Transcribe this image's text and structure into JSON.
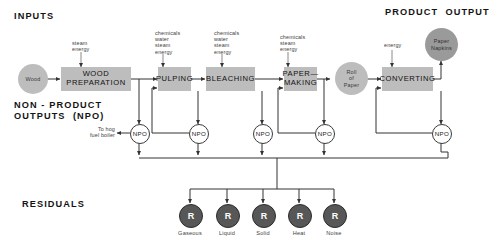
{
  "diagram": {
    "headings": {
      "inputs": "INPUTS",
      "product_output": "PRODUCT  OUTPUT",
      "non_product_outputs": "NON - PRODUCT\nOUTPUTS  (NPO)",
      "residuals": "RESIDUALS"
    },
    "colors": {
      "process_fill": "#bdbdbd",
      "material_fill": "#bdbdbd",
      "product_fill": "#9a9a9a",
      "npo_fill": "#ffffff",
      "residual_fill": "#575757",
      "line": "#333333",
      "text": "#1a1a1a"
    },
    "processes": [
      {
        "id": "wood-preparation",
        "label": "WOOD\nPREPARATION"
      },
      {
        "id": "pulping",
        "label": "PULPING"
      },
      {
        "id": "bleaching",
        "label": "BLEACHING"
      },
      {
        "id": "paper-making",
        "label": "PAPER—\nMAKING"
      },
      {
        "id": "converting",
        "label": "CONVERTING"
      }
    ],
    "materials": [
      {
        "id": "wood",
        "label": "Wood"
      },
      {
        "id": "roll-of-paper",
        "label": "Roll\nof\nPaper"
      }
    ],
    "product": {
      "id": "paper-napkins",
      "label": "Paper\nNapkins"
    },
    "input_labels": [
      {
        "id": "input-wood-preparation",
        "label": "steam\nenergy"
      },
      {
        "id": "input-pulping",
        "label": "chemicals\nwater\nsteam\nenergy"
      },
      {
        "id": "input-bleaching",
        "label": "chemicals\nwater\nsteam\nenergy"
      },
      {
        "id": "input-paper-making",
        "label": "chemicals\nsteam\nenergy"
      },
      {
        "id": "input-converting",
        "label": "energy"
      }
    ],
    "npo_nodes": [
      {
        "id": "npo-wood-preparation",
        "label": "NPO"
      },
      {
        "id": "npo-pulping",
        "label": "NPO"
      },
      {
        "id": "npo-bleaching",
        "label": "NPO"
      },
      {
        "id": "npo-paper-making",
        "label": "NPO"
      },
      {
        "id": "npo-converting",
        "label": "NPO"
      }
    ],
    "hog_fuel_label": "To hog\nfuel boiler",
    "residual_nodes": [
      {
        "id": "residual-gaseous",
        "symbol": "R",
        "label": "Gaseous"
      },
      {
        "id": "residual-liquid",
        "symbol": "R",
        "label": "Liquid"
      },
      {
        "id": "residual-solid",
        "symbol": "R",
        "label": "Solid"
      },
      {
        "id": "residual-heat",
        "symbol": "R",
        "label": "Heat"
      },
      {
        "id": "residual-noise",
        "symbol": "R",
        "label": "Noise"
      }
    ]
  }
}
